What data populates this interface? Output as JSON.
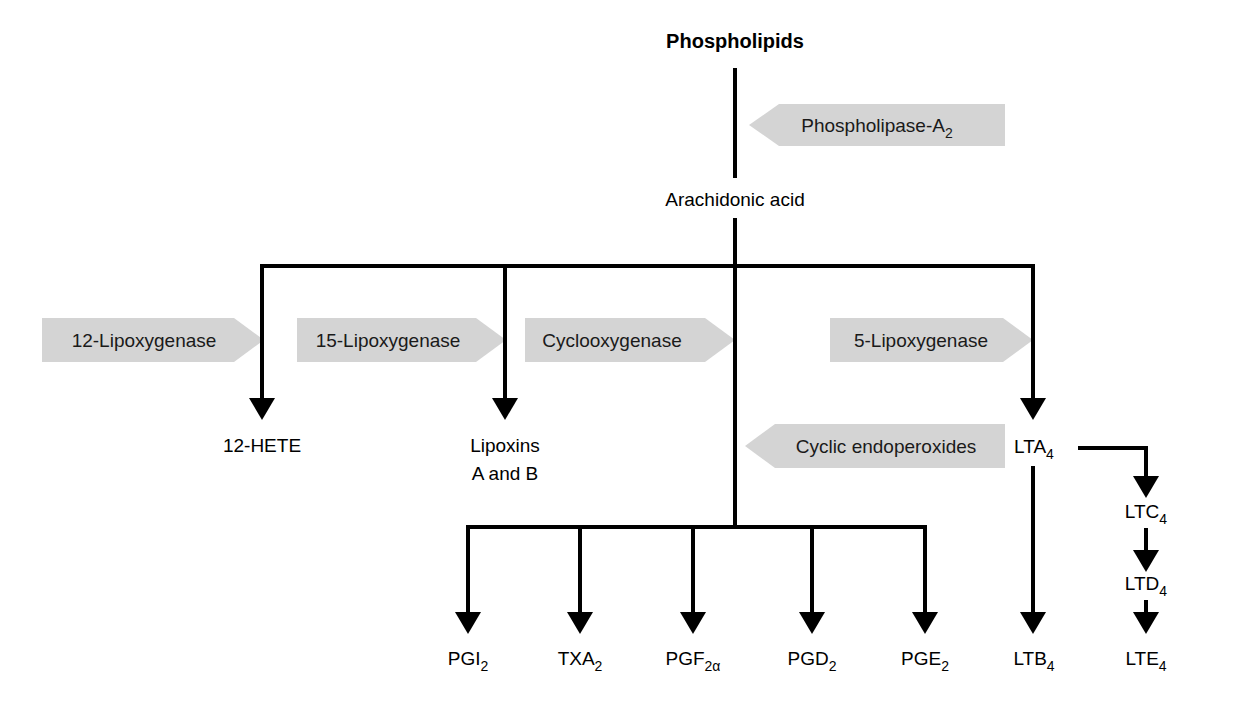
{
  "diagram": {
    "background_color": "#ffffff",
    "line_color": "#000000",
    "banner_color": "#d4d4d4",
    "nodes": {
      "phospholipids": {
        "label": "Phospholipids",
        "bold": true
      },
      "arachidonic_acid": {
        "label": "Arachidonic acid"
      },
      "hete12": {
        "label": "12-HETE"
      },
      "lipoxins_line1": {
        "label": "Lipoxins"
      },
      "lipoxins_line2": {
        "label": "A and B"
      },
      "lta4": {
        "base": "LTA",
        "sub": "4"
      },
      "ltb4": {
        "base": "LTB",
        "sub": "4"
      },
      "ltc4": {
        "base": "LTC",
        "sub": "4"
      },
      "ltd4": {
        "base": "LTD",
        "sub": "4"
      },
      "lte4": {
        "base": "LTE",
        "sub": "4"
      },
      "pgi2": {
        "base": "PGI",
        "sub": "2"
      },
      "txa2": {
        "base": "TXA",
        "sub": "2"
      },
      "pgf2a": {
        "base": "PGF",
        "sub": "2α"
      },
      "pgd2": {
        "base": "PGD",
        "sub": "2"
      },
      "pge2": {
        "base": "PGE",
        "sub": "2"
      }
    },
    "enzymes": {
      "phospholipase_a2": {
        "base": "Phospholipase-A",
        "sub": "2",
        "direction": "left"
      },
      "lipoxygenase12": {
        "label": "12-Lipoxygenase",
        "direction": "right"
      },
      "lipoxygenase15": {
        "label": "15-Lipoxygenase",
        "direction": "right"
      },
      "cyclooxygenase": {
        "label": "Cyclooxygenase",
        "direction": "right"
      },
      "lipoxygenase5": {
        "label": "5-Lipoxygenase",
        "direction": "right"
      },
      "cyclic_endoperoxides": {
        "label": "Cyclic endoperoxides",
        "direction": "left"
      }
    }
  }
}
